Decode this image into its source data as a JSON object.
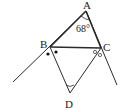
{
  "diagram": {
    "type": "geometry",
    "points": {
      "A": {
        "label": "A",
        "x": 86,
        "y": 11
      },
      "B": {
        "label": "B",
        "x": 50,
        "y": 47
      },
      "C": {
        "label": "C",
        "x": 101,
        "y": 48
      },
      "D": {
        "label": "D",
        "x": 70,
        "y": 93
      }
    },
    "angle_label": "68°",
    "segments": [
      "AB",
      "AC",
      "BC",
      "BD",
      "CD"
    ],
    "extended_rays": [
      "AB beyond B",
      "AC beyond C"
    ],
    "markers": {
      "B": "two dots (equal angles: exterior bisector)",
      "C": "two small circles (equal angles: exterior bisector)",
      "A": "arc for angle 68°",
      "D": "arc for angle at D"
    },
    "colors": {
      "stroke": "#2a2a2a",
      "background": "#ffffff"
    }
  }
}
